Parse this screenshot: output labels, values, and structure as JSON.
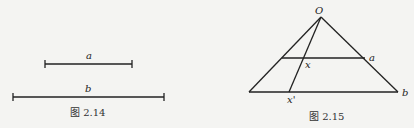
{
  "figures": [
    {
      "caption": "图 2.14",
      "segments": [
        {
          "label": "a"
        },
        {
          "label": "b"
        }
      ]
    },
    {
      "caption": "图 2.15",
      "points": {
        "apex": "O",
        "upper_right": "a",
        "intersection": "x",
        "base_point": "x'",
        "base_right": "b"
      }
    }
  ]
}
